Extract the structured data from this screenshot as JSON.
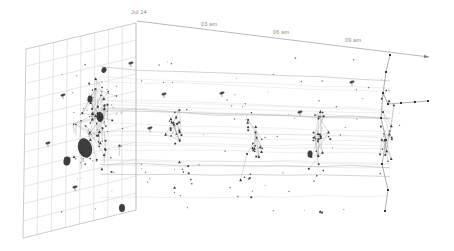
{
  "axis": {
    "origin": {
      "x": 137,
      "y": 21
    },
    "end": {
      "x": 429,
      "y": 57
    },
    "line_color": "#9b9b9b",
    "label_color": "#8a8a8a",
    "labels": [
      {
        "text": "Jul 14",
        "x": 133,
        "y": 16
      },
      {
        "text": "03 am",
        "x": 203,
        "y": 28
      },
      {
        "text": "06 am",
        "x": 275,
        "y": 36
      },
      {
        "text": "09 am",
        "x": 347,
        "y": 44
      }
    ]
  },
  "grid": {
    "corners": {
      "top_left": [
        26,
        49
      ],
      "top_right": [
        136,
        23
      ],
      "bottom_right": [
        136,
        210
      ],
      "bottom_left": [
        23,
        238
      ]
    },
    "columns": 8,
    "rows": 11,
    "line_color": "#c6c6c6",
    "edge_color": "#a9a9a9"
  },
  "network": {
    "node_color": "#3c3c3c",
    "edge_color": "#a0a0a0",
    "stem_color": "#8a8a8a",
    "trajectory_color": "#d2d2d2",
    "trajectory_dark_color": "#b2b2b2",
    "blob_color": "#2e2e2e",
    "chain_color": "#6f6f6f",
    "clusters": [
      {
        "name": "t0-hairball",
        "cx": 97,
        "cy": 125,
        "sx": 27,
        "sy": 52,
        "nodes": 55,
        "edges": 46,
        "seed": 11,
        "tail": 0
      },
      {
        "name": "t1-snapshot",
        "cx": 178,
        "cy": 132,
        "sx": 13,
        "sy": 26,
        "nodes": 22,
        "edges": 19,
        "seed": 22,
        "tail": 60
      },
      {
        "name": "t2-snapshot",
        "cx": 252,
        "cy": 136,
        "sx": 13,
        "sy": 25,
        "nodes": 20,
        "edges": 17,
        "seed": 33,
        "tail": 55
      },
      {
        "name": "t3-snapshot",
        "cx": 318,
        "cy": 138,
        "sx": 13,
        "sy": 36,
        "nodes": 24,
        "edges": 20,
        "seed": 44,
        "tail": 65
      },
      {
        "name": "t4-snapshot",
        "cx": 388,
        "cy": 135,
        "sx": 10,
        "sy": 52,
        "nodes": 20,
        "edges": 14,
        "seed": 55,
        "tail": 0
      }
    ],
    "chain": [
      [
        [
          390,
          55
        ],
        [
          386,
          72
        ],
        [
          383,
          93
        ],
        [
          381,
          118
        ],
        [
          386,
          140
        ],
        [
          382,
          164
        ],
        [
          388,
          190
        ],
        [
          385,
          211
        ]
      ],
      [
        [
          383,
          93
        ],
        [
          388,
          104
        ],
        [
          401,
          103
        ],
        [
          415,
          102
        ],
        [
          428,
          101
        ]
      ]
    ],
    "blobs": [
      {
        "x": 85,
        "y": 148,
        "rx": 7,
        "ry": 10,
        "rot": -15
      },
      {
        "x": 67,
        "y": 161,
        "rx": 3.5,
        "ry": 4.5,
        "rot": 10
      },
      {
        "x": 100,
        "y": 117,
        "rx": 3.5,
        "ry": 5,
        "rot": -5
      },
      {
        "x": 90,
        "y": 99,
        "rx": 2.5,
        "ry": 3.5,
        "rot": 0
      },
      {
        "x": 104,
        "y": 70,
        "rx": 2.5,
        "ry": 3,
        "rot": 20
      },
      {
        "x": 310,
        "y": 154,
        "rx": 2.5,
        "ry": 3.5,
        "rot": 0
      },
      {
        "x": 122,
        "y": 208,
        "rx": 3,
        "ry": 4,
        "rot": 0
      }
    ],
    "satellites": [
      [
        63,
        95
      ],
      [
        48,
        143
      ],
      [
        75,
        187
      ],
      [
        131,
        63
      ],
      [
        150,
        128
      ],
      [
        164,
        94
      ],
      [
        222,
        93
      ],
      [
        300,
        112
      ],
      [
        352,
        82
      ]
    ],
    "trajectories": {
      "count": 22,
      "x_stops": [
        100,
        140,
        178,
        215,
        252,
        285,
        318,
        352,
        390
      ],
      "y_top": 66,
      "y_bottom": 202,
      "seed": 7
    },
    "scatter": {
      "count": 90,
      "seed": 99,
      "x_min": 58,
      "x_max": 402,
      "y_min": 58,
      "y_max": 212
    }
  }
}
